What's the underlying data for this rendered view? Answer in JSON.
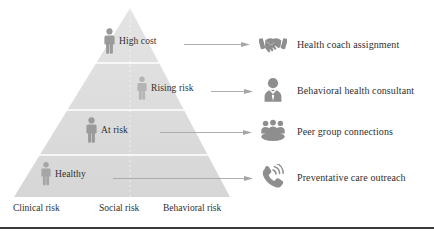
{
  "figure": {
    "name": "risk-stratification-pyramid",
    "pyramid_fill": "#dcdcdc",
    "divider_color": "#ffffff",
    "person_icon_color": "#9a9a9a",
    "outcome_icon_color": "#8e8e8e",
    "arrow_color": "#a0a0a0",
    "text_color": "#2f2f2f",
    "rule_color": "#3b3b3b"
  },
  "pyramid": {
    "tiers": [
      {
        "label": "High cost",
        "icon": "person-icon"
      },
      {
        "label": "Rising risk",
        "icon": "person-icon"
      },
      {
        "label": "At risk",
        "icon": "person-icon"
      },
      {
        "label": "Healthy",
        "icon": "person-icon"
      }
    ]
  },
  "axis": {
    "labels": [
      "Clinical risk",
      "Social risk",
      "Behavioral risk"
    ]
  },
  "outcomes": [
    {
      "label": "Health coach assignment",
      "icon": "handshake-icon"
    },
    {
      "label": "Behavioral health consultant",
      "icon": "business-person-icon"
    },
    {
      "label": "Peer group connections",
      "icon": "peer-group-icon"
    },
    {
      "label": "Preventative care outreach",
      "icon": "ringing-phone-icon"
    }
  ],
  "connectors": [
    {
      "name": "arrow-high-cost-to-health-coach"
    },
    {
      "name": "arrow-rising-risk-to-behavioral-consultant"
    },
    {
      "name": "arrow-at-risk-to-peer-group"
    },
    {
      "name": "arrow-healthy-to-preventative-outreach"
    }
  ]
}
